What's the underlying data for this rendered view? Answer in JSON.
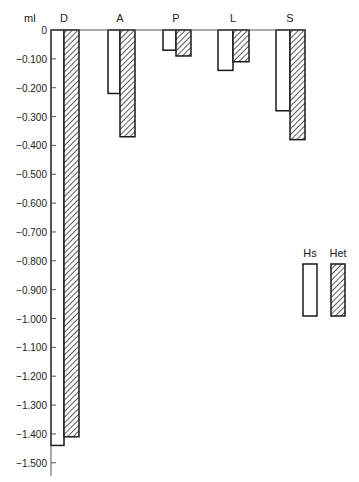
{
  "chart_data": {
    "type": "bar",
    "title": "",
    "xlabel": "",
    "ylabel": "ml",
    "ylim": [
      -1.5,
      0
    ],
    "grid": false,
    "legend_position": "right",
    "categories": [
      "D",
      "A",
      "P",
      "L",
      "S"
    ],
    "series": [
      {
        "name": "Hs",
        "pattern": "open",
        "values": [
          -1.44,
          -0.22,
          -0.07,
          -0.14,
          -0.28
        ]
      },
      {
        "name": "Het",
        "pattern": "hatched",
        "values": [
          -1.41,
          -0.37,
          -0.09,
          -0.11,
          -0.38
        ]
      }
    ],
    "y_ticks": [
      "0",
      "-0.100",
      "-0.200",
      "-0.300",
      "-0.400",
      "-0.500",
      "-0.600",
      "-0.700",
      "-0.800",
      "-0.900",
      "-1.000",
      "-1.100",
      "-1.200",
      "-1.300",
      "-1.400",
      "-1.500"
    ],
    "colors": {
      "stroke": "#1a1a1a",
      "hatch": "#333333",
      "fill": "#ffffff"
    }
  },
  "legend": [
    {
      "label": "Hs",
      "pattern": "open"
    },
    {
      "label": "Het",
      "pattern": "hatched"
    }
  ]
}
